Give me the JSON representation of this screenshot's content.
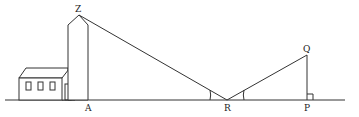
{
  "diagram": {
    "labels": {
      "Z": "Z",
      "A": "A",
      "R": "R",
      "P": "P",
      "Q": "Q"
    },
    "points": {
      "Z": [
        79,
        15
      ],
      "A": [
        88,
        100
      ],
      "R": [
        227,
        100
      ],
      "P": [
        307,
        100
      ],
      "Q": [
        307,
        55
      ]
    },
    "ground": {
      "x1": 5,
      "x2": 345,
      "y": 100
    },
    "stroke_color": "#333333"
  }
}
